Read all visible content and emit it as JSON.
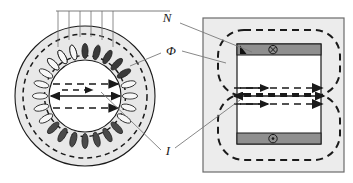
{
  "figure": {
    "labels": {
      "turns": "N",
      "flux": "Φ",
      "current": "I"
    },
    "colors": {
      "outline": "#1a1a1a",
      "core_fill": "#e8e8e8",
      "bore_fill": "#ffffff",
      "panel_fill": "#ececec",
      "conductor_fill": "#8f8f8f",
      "slot_dark_fill": "#3a3a3a",
      "slot_light_fill": "#f2f2f2",
      "leader_line": "#7a7a7a",
      "background": "#ffffff"
    },
    "left_view": {
      "name": "cross-section",
      "center_x": 85,
      "center_y": 96,
      "outer_radius": 70,
      "core_outer_radius": 70,
      "bore_radius": 36,
      "flux_dashed_outer_radius": 62,
      "flux_dashed_inner_radius": 40,
      "slot_count": 24,
      "dark_slot_count": 8,
      "lead_wire_count": 6,
      "bus_line_y": 11,
      "bus_line_x1": 56,
      "bus_line_x2": 170
    },
    "right_view": {
      "name": "developed-view",
      "panel": {
        "x": 203,
        "y": 18,
        "width": 141,
        "height": 154
      },
      "core_rect": {
        "x": 237,
        "y": 44,
        "width": 84,
        "height": 100
      },
      "top_conductor": {
        "x": 237,
        "y": 44,
        "width": 84,
        "height": 11,
        "symbol": "⊗",
        "symbol_meaning": "current-into-page"
      },
      "bottom_conductor": {
        "x": 237,
        "y": 133,
        "width": 84,
        "height": 11,
        "symbol": "⊙",
        "symbol_meaning": "current-out-of-page"
      },
      "triangle_marker": {
        "x": 241,
        "y": 46
      },
      "flux_loops": [
        {
          "name": "upper-flux-loop",
          "x": 218,
          "y": 30,
          "width": 122,
          "height": 66
        },
        {
          "name": "lower-flux-loop",
          "x": 218,
          "y": 94,
          "width": 122,
          "height": 66
        }
      ]
    },
    "arrows": {
      "flux_arrow_label": "flux direction",
      "current_arrow_label": "current axis",
      "left_dashed_rows": [
        84,
        108
      ],
      "left_solid_row": 96,
      "right_dashed_rows": [
        88,
        104
      ],
      "right_solid_row": 96
    },
    "leaders": [
      {
        "name": "leader-N",
        "from": [
          178,
          22
        ],
        "to": [
          252,
          50
        ]
      },
      {
        "name": "leader-phi",
        "from": [
          160,
          52
        ],
        "to": [
          128,
          66
        ]
      },
      {
        "name": "leader-phi-right",
        "from": [
          182,
          50
        ],
        "to": [
          224,
          62
        ]
      },
      {
        "name": "leader-I-left",
        "from": [
          160,
          150
        ],
        "to": [
          100,
          92
        ]
      },
      {
        "name": "leader-I-right",
        "from": [
          176,
          148
        ],
        "to": [
          238,
          100
        ]
      }
    ]
  }
}
